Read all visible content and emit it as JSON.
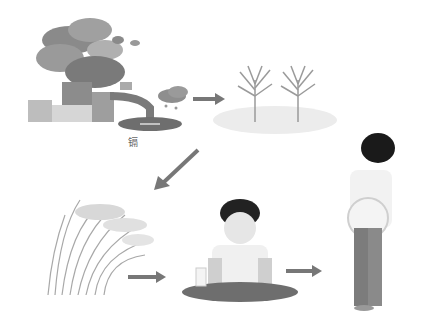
{
  "diagram": {
    "title": "",
    "stages": [
      {
        "id": "factory",
        "label": "镉",
        "description": "Factory emitting smoke and discharging wastewater containing cadmium"
      },
      {
        "id": "rice-paddy",
        "label": "",
        "description": "Rice plants growing in contaminated paddy"
      },
      {
        "id": "rice-crop",
        "label": "",
        "description": "Mature rice crop"
      },
      {
        "id": "person-eating",
        "label": "",
        "description": "Person eating at table"
      },
      {
        "id": "person-ill",
        "label": "",
        "description": "Person with kidney/back pain"
      }
    ],
    "arrows": [
      {
        "from": "factory",
        "to": "rice-paddy"
      },
      {
        "from": "rice-paddy",
        "to": "rice-crop"
      },
      {
        "from": "rice-crop",
        "to": "person-eating"
      },
      {
        "from": "person-eating",
        "to": "person-ill"
      }
    ],
    "colors": {
      "arrow": "#777777",
      "smoke": "#8a8a8a",
      "ground": "#ececec"
    }
  }
}
